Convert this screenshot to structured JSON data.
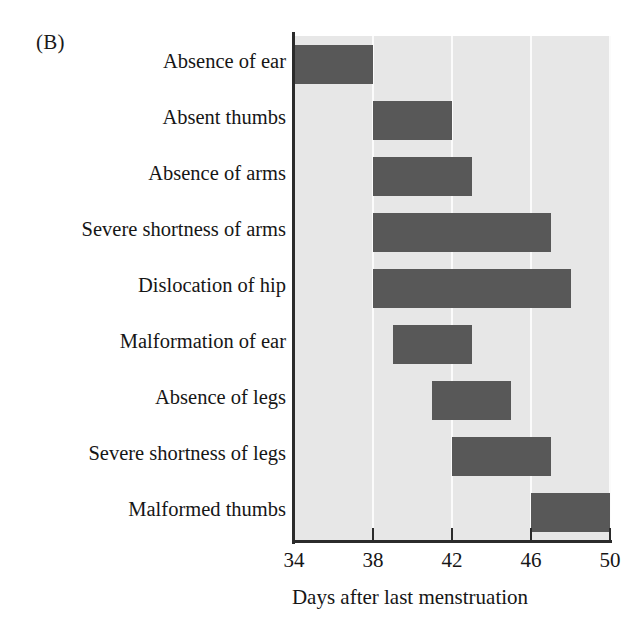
{
  "figure": {
    "panel_label": "(B)",
    "xlabel": "Days after last menstruation",
    "xticks": [
      "34",
      "38",
      "42",
      "46",
      "50"
    ],
    "bar_color": "#585858",
    "plot_background": "#e7e7e7",
    "gridline_color": "#fbfbfb",
    "axis_color": "#2b2b2b"
  },
  "chart_data": {
    "type": "bar",
    "orientation": "horizontal",
    "title": "",
    "panel": "(B)",
    "xlabel": "Days after last menstruation",
    "ylabel": "",
    "xlim": [
      34,
      50
    ],
    "xticks": [
      34,
      38,
      42,
      46,
      50
    ],
    "grid": "vertical gridlines at each x tick (white on light gray panel)",
    "legend": "none",
    "note": "Each bar is a sensitive-period range (start day to end day) of thalidomide exposure producing the named malformation.",
    "categories": [
      "Absence of ear",
      "Absent thumbs",
      "Absence of arms",
      "Severe shortness of arms",
      "Dislocation of hip",
      "Malformation of ear",
      "Absence of legs",
      "Severe shortness of legs",
      "Malformed thumbs"
    ],
    "ranges": [
      {
        "label": "Absence of ear",
        "start": 34,
        "end": 38
      },
      {
        "label": "Absent thumbs",
        "start": 38,
        "end": 42
      },
      {
        "label": "Absence of arms",
        "start": 38,
        "end": 43
      },
      {
        "label": "Severe shortness of arms",
        "start": 38,
        "end": 47
      },
      {
        "label": "Dislocation of hip",
        "start": 38,
        "end": 48
      },
      {
        "label": "Malformation of ear",
        "start": 39,
        "end": 43
      },
      {
        "label": "Absence of legs",
        "start": 41,
        "end": 45
      },
      {
        "label": "Severe shortness of legs",
        "start": 42,
        "end": 47
      },
      {
        "label": "Malformed thumbs",
        "start": 46,
        "end": 50
      }
    ]
  }
}
